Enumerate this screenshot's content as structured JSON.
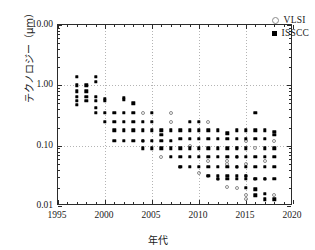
{
  "chart_data": {
    "type": "scatter",
    "title": "",
    "xlabel": "年代",
    "ylabel": "テクノロジー（μm）",
    "xlim": [
      1995,
      2020
    ],
    "ylim": [
      0.01,
      10.0
    ],
    "yscale": "log",
    "xticks": [
      1995,
      2000,
      2005,
      2010,
      2015,
      2020
    ],
    "xtick_labels": [
      "1995",
      "2000",
      "2005",
      "2010",
      "2015",
      "2020"
    ],
    "yticks": [
      0.01,
      0.1,
      1.0,
      10.0
    ],
    "ytick_labels": [
      "0.01",
      "0.10",
      "1.00",
      "10.00"
    ],
    "grid": true,
    "legend_position": "top-right",
    "series": [
      {
        "name": "VLSI",
        "marker": "open-circle",
        "color": "#8a8a8a",
        "points": [
          [
            2004,
            0.35
          ],
          [
            2004,
            0.12
          ],
          [
            2006,
            0.065
          ],
          [
            2007,
            0.35
          ],
          [
            2007,
            0.25
          ],
          [
            2008,
            0.045
          ],
          [
            2009,
            0.1
          ],
          [
            2010,
            0.035
          ],
          [
            2011,
            0.25
          ],
          [
            2011,
            0.055
          ],
          [
            2011,
            0.032
          ],
          [
            2012,
            0.028
          ],
          [
            2013,
            0.055
          ],
          [
            2013,
            0.05
          ],
          [
            2013,
            0.021
          ],
          [
            2014,
            0.09
          ],
          [
            2014,
            0.065
          ],
          [
            2014,
            0.045
          ],
          [
            2014,
            0.02
          ],
          [
            2015,
            0.12
          ],
          [
            2015,
            0.05
          ],
          [
            2015,
            0.032
          ],
          [
            2015,
            0.015
          ],
          [
            2015,
            0.013
          ],
          [
            2016,
            0.09
          ],
          [
            2016,
            0.028
          ],
          [
            2017,
            0.055
          ],
          [
            2017,
            0.028
          ],
          [
            2018,
            0.12
          ],
          [
            2018,
            0.015
          ]
        ]
      },
      {
        "name": "ISSCC",
        "marker": "filled-square",
        "color": "#000000",
        "points": [
          [
            1997,
            1.4
          ],
          [
            1997,
            1.0
          ],
          [
            1997,
            0.8
          ],
          [
            1997,
            0.65
          ],
          [
            1997,
            0.55
          ],
          [
            1997,
            0.48
          ],
          [
            1998,
            1.0
          ],
          [
            1998,
            0.8
          ],
          [
            1998,
            0.65
          ],
          [
            1998,
            0.55
          ],
          [
            1999,
            1.4
          ],
          [
            1999,
            1.15
          ],
          [
            1999,
            0.65
          ],
          [
            1999,
            0.55
          ],
          [
            1999,
            0.42
          ],
          [
            1999,
            0.35
          ],
          [
            2000,
            0.6
          ],
          [
            2000,
            0.55
          ],
          [
            2000,
            0.35
          ],
          [
            2000,
            0.25
          ],
          [
            2001,
            0.35
          ],
          [
            2001,
            0.25
          ],
          [
            2001,
            0.18
          ],
          [
            2001,
            0.12
          ],
          [
            2002,
            0.62
          ],
          [
            2002,
            0.58
          ],
          [
            2002,
            0.35
          ],
          [
            2002,
            0.25
          ],
          [
            2002,
            0.18
          ],
          [
            2002,
            0.12
          ],
          [
            2003,
            0.5
          ],
          [
            2003,
            0.35
          ],
          [
            2003,
            0.25
          ],
          [
            2003,
            0.18
          ],
          [
            2003,
            0.12
          ],
          [
            2004,
            0.25
          ],
          [
            2004,
            0.18
          ],
          [
            2004,
            0.12
          ],
          [
            2004,
            0.09
          ],
          [
            2005,
            0.35
          ],
          [
            2005,
            0.25
          ],
          [
            2005,
            0.18
          ],
          [
            2005,
            0.12
          ],
          [
            2005,
            0.09
          ],
          [
            2006,
            0.18
          ],
          [
            2006,
            0.15
          ],
          [
            2006,
            0.12
          ],
          [
            2006,
            0.09
          ],
          [
            2007,
            0.18
          ],
          [
            2007,
            0.12
          ],
          [
            2007,
            0.09
          ],
          [
            2007,
            0.065
          ],
          [
            2008,
            0.18
          ],
          [
            2008,
            0.13
          ],
          [
            2008,
            0.09
          ],
          [
            2008,
            0.065
          ],
          [
            2008,
            0.045
          ],
          [
            2009,
            0.25
          ],
          [
            2009,
            0.18
          ],
          [
            2009,
            0.13
          ],
          [
            2009,
            0.09
          ],
          [
            2009,
            0.065
          ],
          [
            2009,
            0.045
          ],
          [
            2010,
            0.25
          ],
          [
            2010,
            0.18
          ],
          [
            2010,
            0.13
          ],
          [
            2010,
            0.09
          ],
          [
            2010,
            0.065
          ],
          [
            2010,
            0.045
          ],
          [
            2011,
            0.18
          ],
          [
            2011,
            0.13
          ],
          [
            2011,
            0.09
          ],
          [
            2011,
            0.065
          ],
          [
            2011,
            0.045
          ],
          [
            2011,
            0.032
          ],
          [
            2012,
            0.18
          ],
          [
            2012,
            0.13
          ],
          [
            2012,
            0.09
          ],
          [
            2012,
            0.065
          ],
          [
            2012,
            0.045
          ],
          [
            2012,
            0.032
          ],
          [
            2012,
            0.028
          ],
          [
            2013,
            0.16
          ],
          [
            2013,
            0.13
          ],
          [
            2013,
            0.09
          ],
          [
            2013,
            0.065
          ],
          [
            2013,
            0.045
          ],
          [
            2013,
            0.032
          ],
          [
            2013,
            0.028
          ],
          [
            2014,
            0.18
          ],
          [
            2014,
            0.13
          ],
          [
            2014,
            0.09
          ],
          [
            2014,
            0.065
          ],
          [
            2014,
            0.045
          ],
          [
            2014,
            0.032
          ],
          [
            2014,
            0.028
          ],
          [
            2015,
            0.18
          ],
          [
            2015,
            0.13
          ],
          [
            2015,
            0.09
          ],
          [
            2015,
            0.065
          ],
          [
            2015,
            0.045
          ],
          [
            2015,
            0.032
          ],
          [
            2015,
            0.028
          ],
          [
            2015,
            0.02
          ],
          [
            2016,
            0.35
          ],
          [
            2016,
            0.18
          ],
          [
            2016,
            0.13
          ],
          [
            2016,
            0.065
          ],
          [
            2016,
            0.045
          ],
          [
            2016,
            0.028
          ],
          [
            2016,
            0.019
          ],
          [
            2016,
            0.015
          ],
          [
            2017,
            0.18
          ],
          [
            2017,
            0.13
          ],
          [
            2017,
            0.09
          ],
          [
            2017,
            0.065
          ],
          [
            2017,
            0.045
          ],
          [
            2017,
            0.028
          ],
          [
            2017,
            0.016
          ],
          [
            2017,
            0.013
          ],
          [
            2018,
            0.17
          ],
          [
            2018,
            0.15
          ],
          [
            2018,
            0.09
          ],
          [
            2018,
            0.065
          ],
          [
            2018,
            0.045
          ],
          [
            2018,
            0.028
          ],
          [
            2018,
            0.013
          ]
        ]
      }
    ]
  },
  "legend": {
    "items": [
      {
        "label": "VLSI"
      },
      {
        "label": "ISSCC"
      }
    ]
  }
}
